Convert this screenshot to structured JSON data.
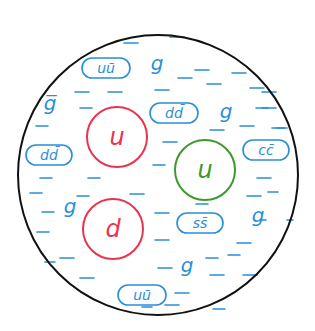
{
  "diagram": {
    "colors": {
      "boundary": "#111111",
      "sea": "#2a8fd6",
      "valence_red": "#e8344e",
      "valence_green": "#3a9a2a"
    },
    "boundary": {
      "cx": 158,
      "cy": 175,
      "r": 140
    },
    "valence_quarks": [
      {
        "label": "u",
        "color": "red",
        "cx": 117,
        "cy": 137,
        "r": 30
      },
      {
        "label": "u",
        "color": "green",
        "cx": 205,
        "cy": 170,
        "r": 30
      },
      {
        "label": "d",
        "color": "red",
        "cx": 113,
        "cy": 229,
        "r": 30
      }
    ],
    "quark_pairs": [
      {
        "label": "uū",
        "x": 82,
        "y": 58,
        "w": 48,
        "h": 20
      },
      {
        "label": "dd̄",
        "x": 150,
        "y": 103,
        "w": 48,
        "h": 20
      },
      {
        "label": "dd̄",
        "x": 26,
        "y": 145,
        "w": 46,
        "h": 20
      },
      {
        "label": "cc̄",
        "x": 243,
        "y": 140,
        "w": 46,
        "h": 20
      },
      {
        "label": "ss̄",
        "x": 177,
        "y": 213,
        "w": 46,
        "h": 20
      },
      {
        "label": "uū",
        "x": 118,
        "y": 285,
        "w": 48,
        "h": 20
      }
    ],
    "gluons": [
      {
        "label": "g",
        "x": 157,
        "y": 70
      },
      {
        "label": "g̅",
        "x": 50,
        "y": 110
      },
      {
        "label": "g",
        "x": 226,
        "y": 118
      },
      {
        "label": "g",
        "x": 70,
        "y": 213
      },
      {
        "label": "g",
        "x": 258,
        "y": 222
      },
      {
        "label": "g",
        "x": 187,
        "y": 272
      }
    ],
    "dashes": [
      [
        124,
        43,
        14
      ],
      [
        170,
        37,
        14
      ],
      [
        75,
        92,
        14
      ],
      [
        108,
        92,
        14
      ],
      [
        155,
        90,
        14
      ],
      [
        178,
        78,
        14
      ],
      [
        195,
        70,
        14
      ],
      [
        232,
        73,
        14
      ],
      [
        207,
        84,
        14
      ],
      [
        250,
        88,
        14
      ],
      [
        262,
        92,
        14
      ],
      [
        80,
        108,
        12
      ],
      [
        36,
        126,
        12
      ],
      [
        262,
        108,
        14
      ],
      [
        240,
        126,
        14
      ],
      [
        210,
        130,
        14
      ],
      [
        277,
        128,
        10
      ],
      [
        256,
        108,
        12
      ],
      [
        272,
        128,
        12
      ],
      [
        163,
        142,
        14
      ],
      [
        40,
        178,
        12
      ],
      [
        88,
        178,
        12
      ],
      [
        153,
        165,
        12
      ],
      [
        257,
        178,
        14
      ],
      [
        268,
        192,
        10
      ],
      [
        30,
        193,
        12
      ],
      [
        77,
        196,
        12
      ],
      [
        130,
        194,
        14
      ],
      [
        247,
        196,
        14
      ],
      [
        260,
        220,
        6
      ],
      [
        287,
        220,
        6
      ],
      [
        42,
        212,
        12
      ],
      [
        37,
        232,
        12
      ],
      [
        155,
        213,
        14
      ],
      [
        196,
        204,
        12
      ],
      [
        237,
        243,
        14
      ],
      [
        155,
        240,
        14
      ],
      [
        182,
        232,
        12
      ],
      [
        206,
        258,
        12
      ],
      [
        228,
        255,
        12
      ],
      [
        60,
        258,
        14
      ],
      [
        158,
        268,
        14
      ],
      [
        210,
        275,
        14
      ],
      [
        243,
        275,
        14
      ],
      [
        45,
        262,
        10
      ],
      [
        80,
        278,
        14
      ],
      [
        175,
        293,
        14
      ],
      [
        213,
        309,
        12
      ],
      [
        165,
        305,
        14
      ],
      [
        142,
        307,
        10
      ]
    ]
  }
}
